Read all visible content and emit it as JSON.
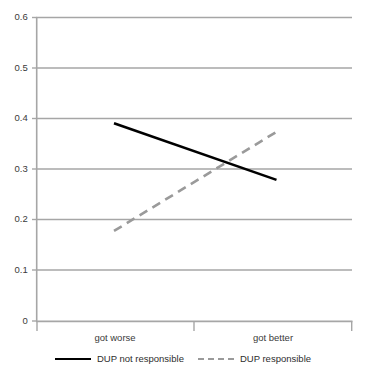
{
  "chart_data": {
    "type": "line",
    "title": "",
    "xlabel": "",
    "ylabel": "",
    "categories": [
      "got worse",
      "got better"
    ],
    "series": [
      {
        "name": "DUP not responsible",
        "values": [
          0.391,
          0.279
        ],
        "style": "solid",
        "color": "#000000"
      },
      {
        "name": "DUP responsible",
        "values": [
          0.178,
          0.374
        ],
        "style": "dashed",
        "color": "#9a9a9a"
      }
    ],
    "ylim": [
      0,
      0.6
    ],
    "yticks": [
      "0",
      "0.1",
      "0.2",
      "0.3",
      "0.4",
      "0.5",
      "0.6"
    ],
    "ytick_values": [
      0,
      0.1,
      0.2,
      0.3,
      0.4,
      0.5,
      0.6
    ],
    "grid": "horizontal",
    "legend_position": "bottom"
  },
  "axes": {
    "y": {
      "t0": "0",
      "t1": "0.1",
      "t2": "0.2",
      "t3": "0.3",
      "t4": "0.4",
      "t5": "0.5",
      "t6": "0.6"
    },
    "x": {
      "c0": "got worse",
      "c1": "got better"
    }
  },
  "legend": {
    "items": [
      {
        "label": "DUP not responsible"
      },
      {
        "label": "DUP responsible"
      }
    ]
  },
  "colors": {
    "series_solid": "#000000",
    "series_dashed": "#9a9a9a",
    "grid": "#a6a6a6",
    "axis": "#a6a6a6",
    "text": "#3a3a3a",
    "background": "#ffffff"
  }
}
